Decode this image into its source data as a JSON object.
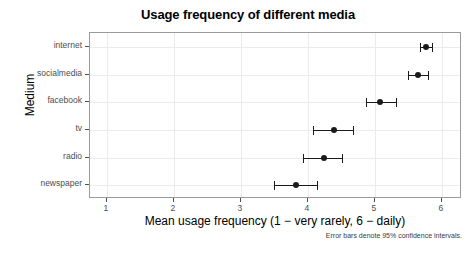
{
  "chart_data": {
    "type": "scatter",
    "title": "Usage frequency of different media",
    "xlabel": "Mean usage frequency (1 − very rarely, 6 − daily)",
    "ylabel": "Medium",
    "caption": "Error bars denote 95% confidence intervals.",
    "xlim": [
      0.75,
      6.3
    ],
    "xticks": [
      1,
      2,
      3,
      4,
      5,
      6
    ],
    "xtick_labels": [
      "1",
      "2",
      "3",
      "4",
      "5",
      "6"
    ],
    "grid": true,
    "legend": "none",
    "orientation": "horizontal",
    "categories": [
      "internet",
      "socialmedia",
      "facebook",
      "tv",
      "radio",
      "newspaper"
    ],
    "values": [
      5.77,
      5.65,
      5.08,
      4.39,
      4.24,
      3.83
    ],
    "ci_low": [
      5.68,
      5.5,
      4.87,
      4.08,
      3.93,
      3.5
    ],
    "ci_high": [
      5.85,
      5.79,
      5.31,
      4.67,
      4.51,
      4.13
    ],
    "points": [
      {
        "category": "internet",
        "mean": 5.77,
        "ci_low": 5.68,
        "ci_high": 5.85
      },
      {
        "category": "socialmedia",
        "mean": 5.65,
        "ci_low": 5.5,
        "ci_high": 5.79
      },
      {
        "category": "facebook",
        "mean": 5.08,
        "ci_low": 4.87,
        "ci_high": 5.31
      },
      {
        "category": "tv",
        "mean": 4.39,
        "ci_low": 4.08,
        "ci_high": 4.67
      },
      {
        "category": "radio",
        "mean": 4.24,
        "ci_low": 3.93,
        "ci_high": 4.51
      },
      {
        "category": "newspaper",
        "mean": 3.83,
        "ci_low": 3.5,
        "ci_high": 4.13
      }
    ],
    "colors": {
      "point": "#1a1a1a",
      "grid": "#ebebeb",
      "panel_border": "#9b9b9b",
      "axis_text": "#4d4d4d",
      "background": "#ffffff"
    }
  }
}
